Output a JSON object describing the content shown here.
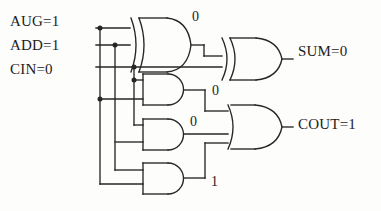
{
  "diagram": {
    "background_color": "#fdfdfc",
    "wire_color": "#262626",
    "text_color": "#1c1c1c",
    "inputs": [
      {
        "name": "AUG",
        "label": "AUG=1",
        "value": "1"
      },
      {
        "name": "ADD",
        "label": "ADD=1",
        "value": "1"
      },
      {
        "name": "CIN",
        "label": "CIN=0",
        "value": "0"
      }
    ],
    "outputs": [
      {
        "name": "SUM",
        "label": "SUM=0",
        "value": "0"
      },
      {
        "name": "COUT",
        "label": "COUT=1",
        "value": "1"
      }
    ],
    "gates": [
      {
        "id": "xor1",
        "type": "XOR",
        "output_value": "0"
      },
      {
        "id": "xor2",
        "type": "XOR",
        "output_value": "0"
      },
      {
        "id": "and1",
        "type": "AND",
        "output_value": "0"
      },
      {
        "id": "and2",
        "type": "AND",
        "output_value": "0"
      },
      {
        "id": "and3",
        "type": "AND",
        "output_value": "1"
      },
      {
        "id": "or1",
        "type": "OR",
        "output_value": "1"
      }
    ],
    "value_labels": {
      "xor1_out": "0",
      "and1_out": "0",
      "and2_out": "0",
      "and3_out": "1"
    }
  }
}
